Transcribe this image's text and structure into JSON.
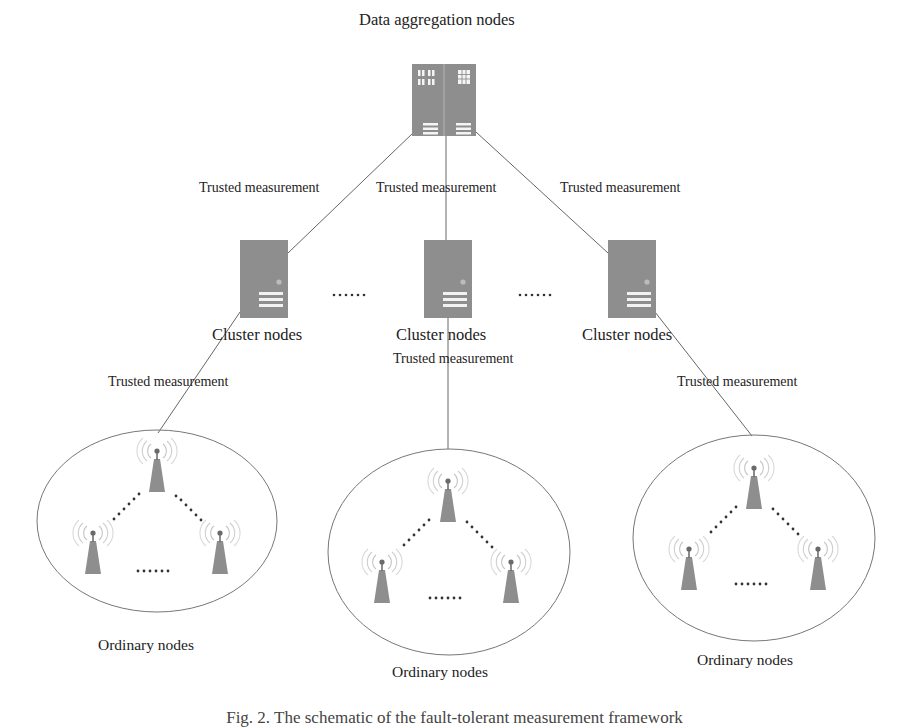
{
  "title": "Data aggregation nodes",
  "edge_label": "Trusted measurement",
  "ellipsis": "......",
  "nodes": {
    "aggregator": {
      "label": "Data aggregation nodes"
    },
    "clusters": [
      {
        "label": "Cluster nodes"
      },
      {
        "label": "Cluster nodes"
      },
      {
        "label": "Cluster nodes"
      }
    ],
    "groups": [
      {
        "label": "Ordinary nodes"
      },
      {
        "label": "Ordinary nodes"
      },
      {
        "label": "Ordinary nodes"
      }
    ]
  },
  "edges": {
    "top": [
      {
        "label": "Trusted measurement"
      },
      {
        "label": "Trusted measurement"
      },
      {
        "label": "Trusted measurement"
      }
    ],
    "bottom": [
      {
        "label": "Trusted measurement"
      },
      {
        "label": "Trusted measurement"
      },
      {
        "label": "Trusted measurement"
      }
    ]
  },
  "caption": "Fig. 2.  The schematic of the fault-tolerant measurement framework",
  "colors": {
    "node_fill": "#8e8e8e",
    "line": "#555555",
    "signal": "#bdbdbd",
    "text": "#222222"
  }
}
